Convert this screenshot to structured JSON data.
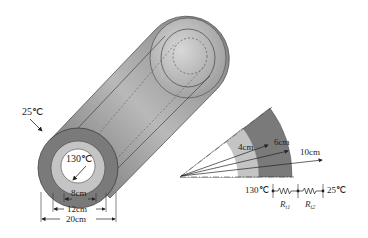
{
  "diagram": {
    "type": "insulated-pipe-heat-conduction",
    "pipe": {
      "outer_temperature_label": "25℃",
      "inner_temperature_label": "130℃",
      "dimensions": [
        {
          "label": "8cm",
          "meaning": "inner diameter"
        },
        {
          "label": "12cm",
          "meaning": "middle layer diameter"
        },
        {
          "label": "20cm",
          "meaning": "outer diameter"
        }
      ]
    },
    "section": {
      "radii": [
        {
          "label": "4cm"
        },
        {
          "label": "6cm"
        },
        {
          "label": "10cm"
        }
      ]
    },
    "circuit": {
      "left_temperature": "130℃",
      "right_temperature": "25℃",
      "resistors": [
        {
          "symbol": "R",
          "subscript": "t1"
        },
        {
          "symbol": "R",
          "subscript": "t2"
        }
      ]
    },
    "colors": {
      "outer_layer": "#7a7a7a",
      "middle_layer": "#c4c4c4",
      "inner_bore": "#ffffff",
      "line": "#222222"
    }
  }
}
